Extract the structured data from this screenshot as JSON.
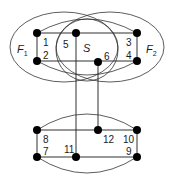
{
  "diagram": {
    "type": "graph",
    "sets": [
      {
        "id": "F1",
        "label": "F",
        "subscript": "1"
      },
      {
        "id": "F2",
        "label": "F",
        "subscript": "2"
      },
      {
        "id": "S",
        "label": "S",
        "subscript": ""
      }
    ],
    "nodes": [
      {
        "id": "1",
        "label": "1"
      },
      {
        "id": "2",
        "label": "2"
      },
      {
        "id": "3",
        "label": "3"
      },
      {
        "id": "4",
        "label": "4"
      },
      {
        "id": "5",
        "label": "5"
      },
      {
        "id": "6",
        "label": "6"
      },
      {
        "id": "7",
        "label": "7"
      },
      {
        "id": "8",
        "label": "8"
      },
      {
        "id": "9",
        "label": "9"
      },
      {
        "id": "10",
        "label": "10"
      },
      {
        "id": "11",
        "label": "11"
      },
      {
        "id": "12",
        "label": "12"
      }
    ],
    "edges": [
      [
        "1",
        "2"
      ],
      [
        "3",
        "4"
      ],
      [
        "1",
        "5"
      ],
      [
        "5",
        "3"
      ],
      [
        "2",
        "6"
      ],
      [
        "6",
        "4"
      ],
      [
        "1",
        "3"
      ],
      [
        "2",
        "4"
      ],
      [
        "5",
        "11"
      ],
      [
        "6",
        "12"
      ],
      [
        "8",
        "7"
      ],
      [
        "10",
        "9"
      ],
      [
        "8",
        "12"
      ],
      [
        "12",
        "10"
      ],
      [
        "7",
        "11"
      ],
      [
        "11",
        "9"
      ],
      [
        "8",
        "10"
      ],
      [
        "7",
        "9"
      ]
    ]
  }
}
